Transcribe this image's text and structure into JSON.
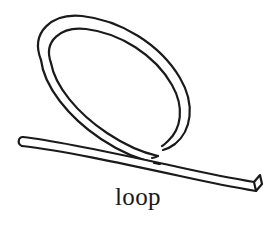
{
  "figure": {
    "title": "loop",
    "caption": "loop",
    "style": "black-and-white line drawing",
    "background_color": "#ffffff",
    "ink_color": "#1a1a1a",
    "canvas": {
      "width": 276,
      "height": 232
    }
  },
  "caption": {
    "text": "loop",
    "font_style": "serif",
    "font_size_px": 25,
    "color": "#1a1a1a",
    "align": "center"
  },
  "drawing": {
    "stroke_color": "#1a1a1a",
    "fill_color": "#ffffff",
    "stroke_width": 2.2,
    "cord_thickness_px": 9,
    "parts": [
      {
        "name": "loop-ring",
        "description": "large elongated oval loop tilted from upper-left to lower-right"
      },
      {
        "name": "straight-strand",
        "description": "straight length of cord running from lower-left up to the right, crossing under the loop"
      },
      {
        "name": "left-end-cap",
        "description": "flat rounded cut end of cord at left"
      },
      {
        "name": "right-end-cap",
        "description": "angled cut face of cord at right showing the cross-section"
      },
      {
        "name": "crossing-point",
        "description": "point where the loop strand passes behind the straight strand"
      }
    ]
  }
}
